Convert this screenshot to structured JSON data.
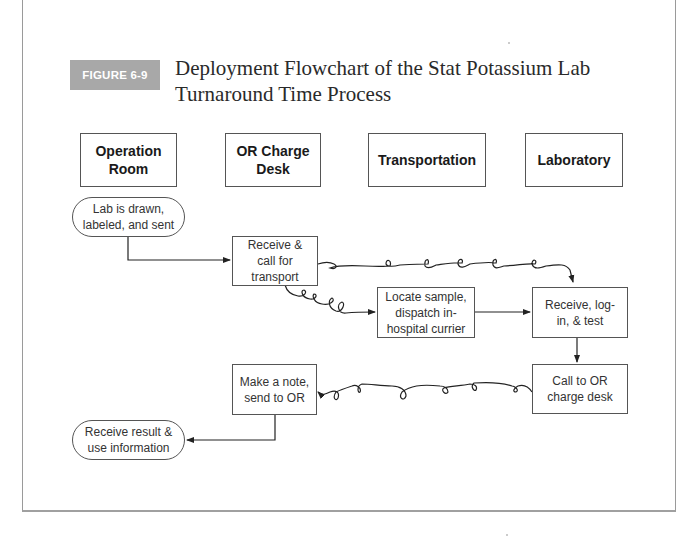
{
  "figure": {
    "label": "FIGURE 6-9",
    "title_line1": "Deployment Flowchart of the Stat Potassium Lab",
    "title_line2": "Turnaround Time Process",
    "badge_color": "#a8a8a8"
  },
  "swimlanes": [
    {
      "label_line1": "Operation",
      "label_line2": "Room"
    },
    {
      "label_line1": "OR Charge",
      "label_line2": "Desk"
    },
    {
      "label_line1": "Transportation"
    },
    {
      "label_line1": "Laboratory"
    }
  ],
  "steps": {
    "lab_drawn": {
      "line1": "Lab is drawn,",
      "line2": "labeled, and sent",
      "shape": "terminator",
      "lane": "Operation Room"
    },
    "receive_call": {
      "line1": "Receive &",
      "line2": "call for",
      "line3": "transport",
      "shape": "process",
      "lane": "OR Charge Desk"
    },
    "locate_sample": {
      "line1": "Locate sample,",
      "line2": "dispatch in-",
      "line3": "hospital currier",
      "shape": "process",
      "lane": "Transportation"
    },
    "receive_test": {
      "line1": "Receive, log-",
      "line2": "in, & test",
      "shape": "process",
      "lane": "Laboratory"
    },
    "call_or": {
      "line1": "Call to OR",
      "line2": "charge desk",
      "shape": "process",
      "lane": "Laboratory"
    },
    "make_note": {
      "line1": "Make a note,",
      "line2": "send to OR",
      "shape": "process",
      "lane": "OR Charge Desk"
    },
    "receive_result": {
      "line1": "Receive result &",
      "line2": "use information",
      "shape": "terminator",
      "lane": "Operation Room"
    }
  },
  "connectors": [
    {
      "from": "Lab is drawn, labeled, and sent",
      "to": "Receive & call for transport",
      "style": "straight"
    },
    {
      "from": "Receive & call for transport",
      "to": "Receive, log-in, & test",
      "style": "curly"
    },
    {
      "from": "Receive & call for transport",
      "to": "Locate sample, dispatch in-hospital currier",
      "style": "curly"
    },
    {
      "from": "Locate sample, dispatch in-hospital currier",
      "to": "Receive, log-in, & test",
      "style": "straight"
    },
    {
      "from": "Receive, log-in, & test",
      "to": "Call to OR charge desk",
      "style": "straight"
    },
    {
      "from": "Call to OR charge desk",
      "to": "Make a note, send to OR",
      "style": "curly"
    },
    {
      "from": "Make a note, send to OR",
      "to": "Receive result & use information",
      "style": "straight"
    }
  ]
}
